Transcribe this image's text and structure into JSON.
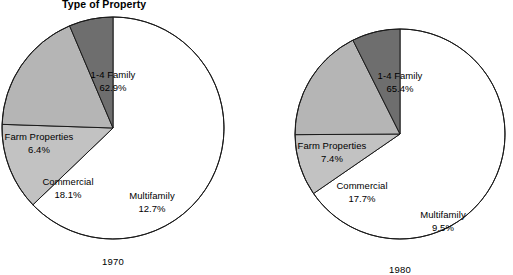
{
  "header": {
    "title": "Type of Property"
  },
  "chart_data": {
    "type": "pie",
    "title": "Type of Property",
    "xlabel": "",
    "ylabel": "",
    "legend": "none",
    "grid": false,
    "categories": [
      "1-4 Family",
      "Multifamily",
      "Commercial",
      "Farm Properties"
    ],
    "colors": {
      "1-4 Family": "#ffffff",
      "Multifamily": "#c2c2c2",
      "Commercial": "#b5b5b5",
      "Farm Properties": "#6e6e6e",
      "outline": "#1a1a1a"
    },
    "charts": [
      {
        "name": "1970",
        "year_label": "1970",
        "center": [
          113,
          128
        ],
        "radius": 111,
        "slices": [
          {
            "label": "1-4 Family",
            "value": 62.9,
            "pct_text": "62.9%",
            "color": "#ffffff",
            "label_pos": [
              113,
              76
            ]
          },
          {
            "label": "Multifamily",
            "value": 12.7,
            "pct_text": "12.7%",
            "color": "#c2c2c2",
            "label_pos": [
              152,
              196
            ]
          },
          {
            "label": "Commercial",
            "value": 18.1,
            "pct_text": "18.1%",
            "color": "#b5b5b5",
            "label_pos": [
              68,
              182
            ]
          },
          {
            "label": "Farm Properties",
            "value": 6.4,
            "pct_text": "6.4%",
            "color": "#6e6e6e",
            "label_pos": [
              36,
              138
            ]
          }
        ]
      },
      {
        "name": "1980",
        "year_label": "1980",
        "center": [
          400,
          134
        ],
        "radius": 105,
        "slices": [
          {
            "label": "1-4 Family",
            "value": 65.4,
            "pct_text": "65.4%",
            "color": "#ffffff",
            "label_pos": [
              400,
              77
            ]
          },
          {
            "label": "Multifamily",
            "value": 9.5,
            "pct_text": "9.5%",
            "color": "#c2c2c2",
            "label_pos": [
              443,
              215
            ]
          },
          {
            "label": "Commercial",
            "value": 17.7,
            "pct_text": "17.7%",
            "color": "#b5b5b5",
            "label_pos": [
              362,
              186
            ]
          },
          {
            "label": "Farm Properties",
            "value": 7.4,
            "pct_text": "7.4%",
            "color": "#6e6e6e",
            "label_pos": [
              331,
              147
            ]
          }
        ]
      }
    ]
  },
  "labels": {
    "left": {
      "family_name": "1-4 Family",
      "family_pct": "62.9%",
      "multi_name": "Multifamily",
      "multi_pct": "12.7%",
      "commercial_name": "Commercial",
      "commercial_pct": "18.1%",
      "farm_name": "Farm Properties",
      "farm_pct": "6.4%",
      "year": "1970"
    },
    "right": {
      "family_name": "1-4 Family",
      "family_pct": "65.4%",
      "multi_name": "Multifamily",
      "multi_pct": "9.5%",
      "commercial_name": "Commercial",
      "commercial_pct": "17.7%",
      "farm_name": "Farm Properties",
      "farm_pct": "7.4%",
      "year": "1980"
    }
  }
}
